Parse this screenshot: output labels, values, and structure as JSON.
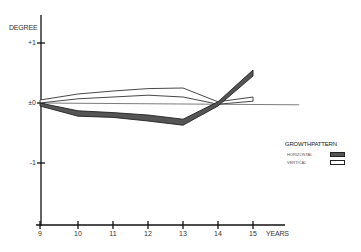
{
  "chart_data": {
    "type": "line",
    "title": "",
    "xlabel": "YEARS",
    "ylabel": "DEGREE",
    "x": [
      9,
      10,
      11,
      12,
      13,
      14,
      15
    ],
    "x_tick_labels": [
      "9",
      "10",
      "11",
      "12",
      "13",
      "14",
      "15"
    ],
    "y_tick_labels": [
      "+1",
      "±0",
      "-1"
    ],
    "y_ticks": [
      1,
      0,
      -1
    ],
    "ylim": [
      -2,
      1.5
    ],
    "grid": false,
    "legend": {
      "title": "GROWTHPATTERN",
      "position": "right",
      "entries": [
        "HORIZONTAL",
        "VERTICAL"
      ]
    },
    "series": [
      {
        "name": "HORIZONTAL",
        "style": "dark filled band",
        "upper": [
          0,
          -0.13,
          -0.16,
          -0.2,
          -0.27,
          0.02,
          0.55
        ],
        "lower": [
          -0.05,
          -0.22,
          -0.24,
          -0.3,
          -0.37,
          -0.05,
          0.45
        ]
      },
      {
        "name": "VERTICAL",
        "style": "white band with outline",
        "upper": [
          0.05,
          0.15,
          0.2,
          0.24,
          0.25,
          0.02,
          0.1
        ],
        "lower": [
          0,
          0.07,
          0.1,
          0.13,
          0.1,
          -0.02,
          0.03
        ]
      },
      {
        "name": "baseline",
        "style": "thin line",
        "x": [
          9,
          16.3
        ],
        "values": [
          0,
          -0.03
        ]
      }
    ]
  },
  "labels": {
    "ylabel": "DEGREE",
    "xlabel": "YEARS",
    "yticks": [
      "+1",
      "±0",
      "-1"
    ],
    "xticks": [
      "9",
      "10",
      "11",
      "12",
      "13",
      "14",
      "15"
    ],
    "legend_title": "GROWTHPATTERN",
    "legend_horizontal": "HORIZONTAL",
    "legend_vertical": "VERTICAL"
  },
  "colors": {
    "axis": "#111111",
    "horizontal_fill": "#555555",
    "horizontal_stroke": "#222222",
    "vertical_fill": "#ffffff",
    "vertical_stroke": "#333333"
  }
}
